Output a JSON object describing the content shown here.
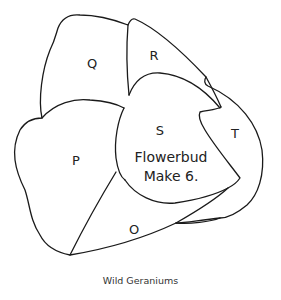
{
  "diagram": {
    "pieces": [
      {
        "id": "O",
        "label": "O",
        "x": 134,
        "y": 229
      },
      {
        "id": "P",
        "label": "P",
        "x": 76,
        "y": 160
      },
      {
        "id": "Q",
        "label": "Q",
        "x": 92,
        "y": 63
      },
      {
        "id": "R",
        "label": "R",
        "x": 154,
        "y": 55
      },
      {
        "id": "S",
        "label": "S",
        "x": 160,
        "y": 130
      },
      {
        "id": "T",
        "label": "T",
        "x": 235,
        "y": 133
      }
    ],
    "center_text": {
      "line1": "Flowerbud",
      "line2": "Make 6."
    },
    "caption": "Wild Geraniums",
    "stroke_color": "#1a1a1a",
    "background": "#ffffff"
  }
}
